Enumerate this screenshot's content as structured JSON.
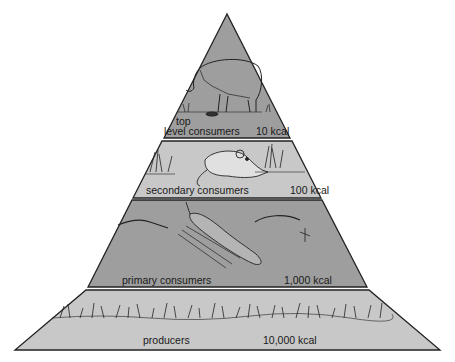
{
  "colors": {
    "tier_dark": "#9e9e9e",
    "tier_light": "#c8c8c8",
    "outline": "#222222",
    "background": "#ffffff"
  },
  "tiers": [
    {
      "name": "top level consumers",
      "label_line1": "top",
      "label_line2": "level consumers",
      "energy": "10 kcal",
      "icon": "wolf-illustration",
      "shade": "dark"
    },
    {
      "name": "secondary consumers",
      "label": "secondary consumers",
      "energy": "100 kcal",
      "icon": "mouse-illustration",
      "shade": "light"
    },
    {
      "name": "primary consumers",
      "label": "primary consumers",
      "energy": "1,000 kcal",
      "icon": "grasshopper-illustration",
      "shade": "dark"
    },
    {
      "name": "producers",
      "label": "producers",
      "energy": "10,000 kcal",
      "icon": "grass-illustration",
      "shade": "light"
    }
  ]
}
